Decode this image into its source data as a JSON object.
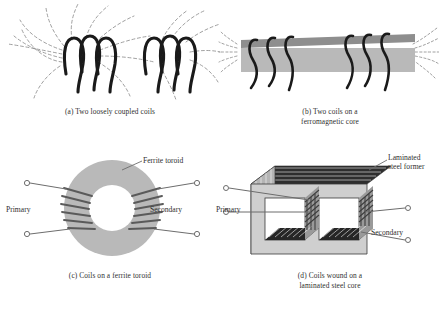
{
  "figure": {
    "background_color": "#ffffff",
    "ink_color": "#2f2f2f",
    "flux_color": "#8f8f8f",
    "core_gray": "#b9b9b9",
    "lamination_dark": "#262626"
  },
  "panels": [
    {
      "id": "a",
      "caption": "(a) Two loosely coupled coils",
      "subject": "two air-cored coils with spreading dashed magnetic flux lines",
      "coil_turns": 3,
      "coil_count": 2,
      "has_core": false,
      "flux_lines_visible": true
    },
    {
      "id": "b",
      "caption": "(b) Two coils on a\nferromagnetic core",
      "subject": "two coils wound on a common straight ferromagnetic bar core",
      "coil_turns": 3,
      "coil_count": 2,
      "has_core": true,
      "core_type": "ferromagnetic bar",
      "flux_lines_visible": true
    },
    {
      "id": "c",
      "caption": "(c) Coils on a ferrite toroid",
      "subject": "primary and secondary windings on a ferrite ring core",
      "coil_count": 2,
      "has_core": true,
      "core_type": "ferrite toroid",
      "flux_lines_visible": false,
      "labels": [
        {
          "text": "Ferrite toroid",
          "role": "core-callout"
        },
        {
          "text": "Primary",
          "role": "winding-label"
        },
        {
          "text": "Secondary",
          "role": "winding-label"
        }
      ],
      "terminal_count": 4
    },
    {
      "id": "d",
      "caption": "(d) Coils wound on a\nlaminated steel core",
      "subject": "primary and secondary coils on a laminated steel shell-type core drawn in 3D",
      "coil_count": 2,
      "has_core": true,
      "core_type": "laminated steel former",
      "flux_lines_visible": false,
      "labels": [
        {
          "text": "Laminated\nsteel former",
          "role": "core-callout"
        },
        {
          "text": "Primary",
          "role": "winding-label"
        },
        {
          "text": "Secondary",
          "role": "winding-label"
        }
      ],
      "terminal_count": 4
    }
  ],
  "labels": {
    "ferrite_toroid": "Ferrite toroid",
    "primary_c": "Primary",
    "secondary_c": "Secondary",
    "laminated_steel_former": "Laminated\nsteel former",
    "primary_d": "Primary",
    "secondary_d": "Secondary"
  },
  "captions": {
    "a": "(a) Two loosely coupled coils",
    "b": "(b) Two coils on a\nferromagnetic core",
    "c": "(c) Coils on a ferrite toroid",
    "d": "(d) Coils wound on a\nlaminated steel core"
  }
}
